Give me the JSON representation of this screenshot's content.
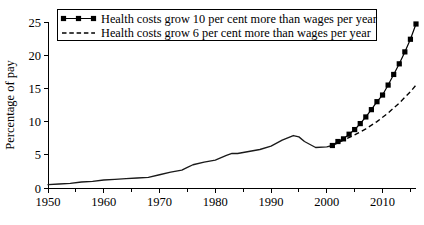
{
  "chart_data": {
    "type": "line",
    "title": "",
    "xlabel": "",
    "ylabel": "Percentage of pay",
    "xlim": [
      1950,
      2016
    ],
    "ylim": [
      0,
      25
    ],
    "grid": false,
    "legend_position": "top-left",
    "x_ticks_major": [
      1950,
      1960,
      1970,
      1980,
      1990,
      2000,
      2010
    ],
    "x_ticks_minor": [
      1955,
      1965,
      1975,
      1985,
      1995,
      2005,
      2015
    ],
    "y_ticks": [
      0,
      5,
      10,
      15,
      20,
      25
    ],
    "series": [
      {
        "name": "Historical",
        "style": "solid",
        "marker": "none",
        "color": "#1a1a1a",
        "x": [
          1950,
          1952,
          1954,
          1956,
          1958,
          1960,
          1962,
          1964,
          1966,
          1968,
          1970,
          1972,
          1974,
          1975,
          1976,
          1978,
          1980,
          1982,
          1983,
          1984,
          1986,
          1988,
          1990,
          1992,
          1994,
          1995,
          1996,
          1998,
          2000,
          2001
        ],
        "values": [
          0.5,
          0.6,
          0.7,
          0.9,
          1.0,
          1.2,
          1.3,
          1.4,
          1.5,
          1.6,
          2.0,
          2.4,
          2.7,
          3.1,
          3.5,
          3.9,
          4.2,
          4.9,
          5.2,
          5.2,
          5.5,
          5.8,
          6.3,
          7.2,
          7.9,
          7.7,
          7.0,
          6.1,
          6.2,
          6.4
        ]
      },
      {
        "name": "Health costs grow 10 per cent more than wages per year",
        "style": "solid",
        "marker": "square",
        "color": "#000000",
        "x": [
          2001,
          2002,
          2003,
          2004,
          2005,
          2006,
          2007,
          2008,
          2009,
          2010,
          2011,
          2012,
          2013,
          2014,
          2015,
          2016
        ],
        "values": [
          6.4,
          7.0,
          7.4,
          8.1,
          8.8,
          9.7,
          10.7,
          11.8,
          13.0,
          14.0,
          15.5,
          17.1,
          18.7,
          20.5,
          22.4,
          24.7
        ]
      },
      {
        "name": "Health costs grow 6 per cent more than wages per year",
        "style": "dashed",
        "marker": "none",
        "color": "#000000",
        "x": [
          2001,
          2003,
          2005,
          2007,
          2009,
          2011,
          2013,
          2015,
          2016
        ],
        "values": [
          6.4,
          7.2,
          8.0,
          8.9,
          10.0,
          11.3,
          12.8,
          14.5,
          15.5
        ]
      }
    ]
  },
  "legend": {
    "items": [
      {
        "label": "Health costs grow 10 per cent more than wages per year",
        "style": "solid-square"
      },
      {
        "label": "Health costs grow 6 per cent more than wages per year",
        "style": "dashed"
      }
    ]
  },
  "axes": {
    "y_title": "Percentage of pay",
    "y_labels": [
      "0",
      "5",
      "10",
      "15",
      "20",
      "25"
    ],
    "x_labels": [
      "1950",
      "1960",
      "1970",
      "1980",
      "1990",
      "2000",
      "2010"
    ]
  }
}
